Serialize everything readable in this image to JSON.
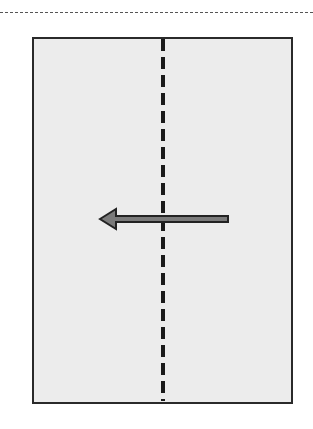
{
  "diagram": {
    "top_fold_line": {
      "style": "dashed",
      "color": "#555555"
    },
    "paper": {
      "fill": "#ececec",
      "border_color": "#2a2a2a"
    },
    "fold_line": {
      "orientation": "vertical",
      "style": "dashed",
      "color": "#1a1a1a"
    },
    "arrow": {
      "direction": "left",
      "fill": "#7a7a7a",
      "outline": "#222222"
    }
  }
}
